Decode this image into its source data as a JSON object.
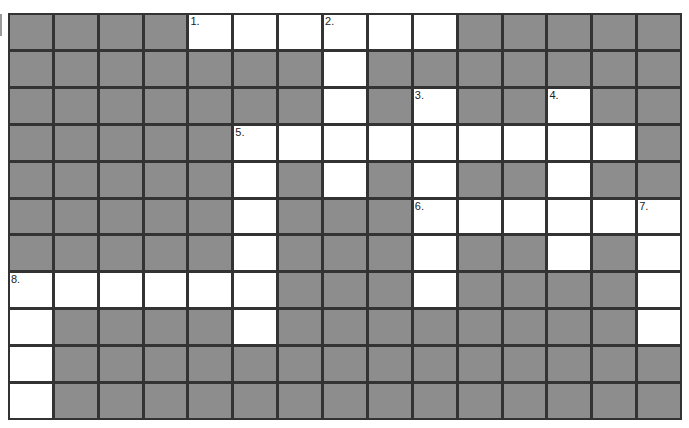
{
  "puzzle": {
    "type": "crossword",
    "rows": 11,
    "cols": 15,
    "colors": {
      "blocked": "#8d8d8d",
      "open": "#ffffff",
      "lines": "#333333"
    },
    "open_cells": [
      [
        0,
        4
      ],
      [
        0,
        5
      ],
      [
        0,
        6
      ],
      [
        0,
        7
      ],
      [
        0,
        8
      ],
      [
        0,
        9
      ],
      [
        1,
        7
      ],
      [
        2,
        7
      ],
      [
        2,
        9
      ],
      [
        2,
        12
      ],
      [
        3,
        5
      ],
      [
        3,
        6
      ],
      [
        3,
        7
      ],
      [
        3,
        8
      ],
      [
        3,
        9
      ],
      [
        3,
        10
      ],
      [
        3,
        11
      ],
      [
        3,
        12
      ],
      [
        3,
        13
      ],
      [
        4,
        5
      ],
      [
        4,
        7
      ],
      [
        4,
        9
      ],
      [
        4,
        12
      ],
      [
        5,
        5
      ],
      [
        5,
        9
      ],
      [
        5,
        10
      ],
      [
        5,
        11
      ],
      [
        5,
        12
      ],
      [
        5,
        13
      ],
      [
        5,
        14
      ],
      [
        6,
        5
      ],
      [
        6,
        9
      ],
      [
        6,
        12
      ],
      [
        6,
        14
      ],
      [
        7,
        0
      ],
      [
        7,
        1
      ],
      [
        7,
        2
      ],
      [
        7,
        3
      ],
      [
        7,
        4
      ],
      [
        7,
        5
      ],
      [
        7,
        9
      ],
      [
        7,
        14
      ],
      [
        8,
        0
      ],
      [
        8,
        5
      ],
      [
        8,
        14
      ],
      [
        9,
        0
      ],
      [
        10,
        0
      ]
    ],
    "numbers": [
      {
        "r": 0,
        "c": 4,
        "label": "1."
      },
      {
        "r": 0,
        "c": 7,
        "label": "2."
      },
      {
        "r": 2,
        "c": 9,
        "label": "3."
      },
      {
        "r": 2,
        "c": 12,
        "label": "4."
      },
      {
        "r": 3,
        "c": 5,
        "label": "5."
      },
      {
        "r": 5,
        "c": 9,
        "label": "6."
      },
      {
        "r": 5,
        "c": 14,
        "label": "7."
      },
      {
        "r": 7,
        "c": 0,
        "label": "8."
      }
    ]
  }
}
